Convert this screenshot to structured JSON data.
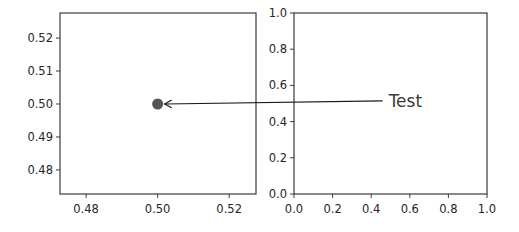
{
  "figure": {
    "width": 519,
    "height": 232,
    "background": "#ffffff"
  },
  "chart_data": [
    {
      "type": "scatter",
      "title": "",
      "xlabel": "",
      "ylabel": "",
      "xlim": [
        0.4727,
        0.5275
      ],
      "ylim": [
        0.4727,
        0.5276
      ],
      "grid": false,
      "legend": null,
      "x_ticks": [
        0.48,
        0.5,
        0.52
      ],
      "x_tick_labels": [
        "0.48",
        "0.50",
        "0.52"
      ],
      "y_ticks": [
        0.48,
        0.49,
        0.5,
        0.51,
        0.52
      ],
      "y_tick_labels": [
        "0.48",
        "0.49",
        "0.50",
        "0.51",
        "0.52"
      ],
      "series": [
        {
          "name": "point",
          "x": [
            0.5
          ],
          "y": [
            0.5
          ],
          "color": "#555555",
          "marker": "o"
        }
      ],
      "bbox_px": {
        "left": 60,
        "top": 13,
        "right": 256,
        "bottom": 194
      }
    },
    {
      "type": "scatter",
      "title": "",
      "xlabel": "",
      "ylabel": "",
      "xlim": [
        0.0,
        1.0
      ],
      "ylim": [
        0.0,
        1.0
      ],
      "grid": false,
      "legend": null,
      "x_ticks": [
        0.0,
        0.2,
        0.4,
        0.6,
        0.8,
        1.0
      ],
      "x_tick_labels": [
        "0.0",
        "0.2",
        "0.4",
        "0.6",
        "0.8",
        "1.0"
      ],
      "y_ticks": [
        0.0,
        0.2,
        0.4,
        0.6,
        0.8,
        1.0
      ],
      "y_tick_labels": [
        "0.0",
        "0.2",
        "0.4",
        "0.6",
        "0.8",
        "1.0"
      ],
      "series": [],
      "bbox_px": {
        "left": 294,
        "top": 13,
        "right": 487,
        "bottom": 194
      }
    }
  ],
  "annotation": {
    "text": "Test",
    "text_position_axes2": [
      0.48,
      0.52
    ],
    "arrow_target_axes1": [
      0.5,
      0.5
    ],
    "arrow_style": "->",
    "color": "#1a1a1a"
  },
  "colors": {
    "spine": "#3a3a3a",
    "text": "#262626",
    "marker": "#555555"
  }
}
